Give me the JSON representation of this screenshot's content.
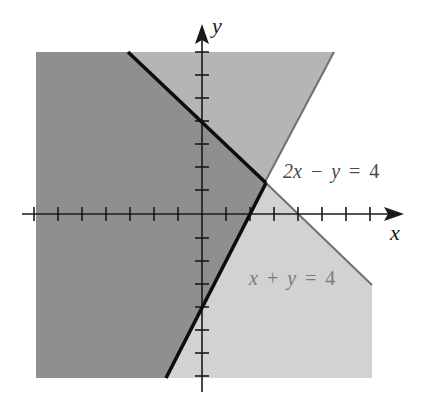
{
  "figure": {
    "type": "system-of-linear-inequalities-graph",
    "axes": {
      "x_label": "x",
      "y_label": "y",
      "x_range": [
        -7,
        7
      ],
      "y_range": [
        -7,
        7
      ],
      "tick_step": 1
    },
    "lines": [
      {
        "id": "line-1",
        "equation_label": {
          "a": "x",
          "op1": "+",
          "b": "y",
          "eq": "=",
          "c": "4"
        },
        "equation_text": "x + y = 4",
        "boundary_of_solution": "thick black segment left of intersection, thin gray segment beyond"
      },
      {
        "id": "line-2",
        "equation_label": {
          "a": "2x",
          "op1": "−",
          "b": "y",
          "eq": "=",
          "c": "4"
        },
        "equation_text": "2x − y = 4",
        "boundary_of_solution": "thick black segment below intersection, thin gray segment beyond"
      }
    ],
    "intersection": {
      "x": "8/3",
      "y": "4/3"
    },
    "regions": [
      {
        "id": "solution-region",
        "description": "x + y ≤ 4 and 2x − y ≤ 4",
        "color": "#8f8f8f"
      },
      {
        "id": "upper-wedge",
        "description": "2x − y ≤ 4 only",
        "color": "#b5b5b5"
      },
      {
        "id": "lower-wedge",
        "description": "x + y ≤ 4 only",
        "color": "#d2d2d2"
      }
    ],
    "colors": {
      "axis": "#1a1a1a",
      "boundary_thick": "#0d0d0d",
      "boundary_thin": "#707070",
      "label_dark": "#4a4a4a",
      "label_light": "#7a7a7a"
    }
  }
}
